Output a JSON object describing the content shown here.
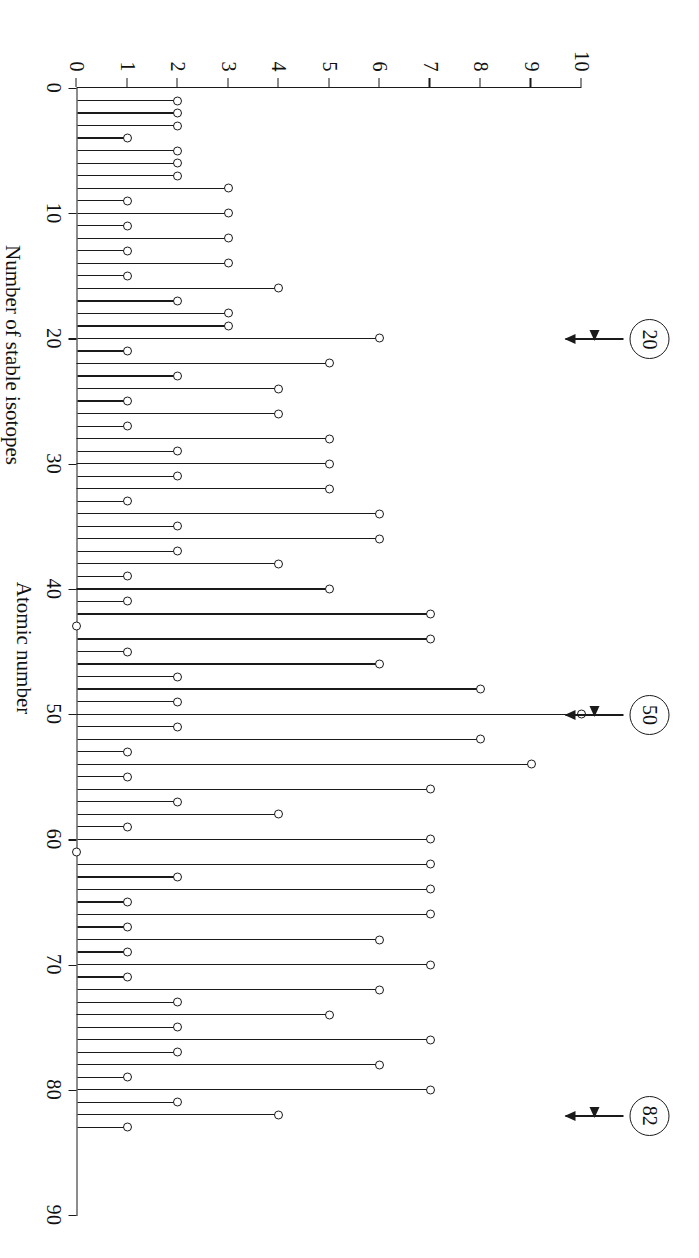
{
  "figure": {
    "kind": "stem-plot",
    "rotation_degrees": 90,
    "background_color": "#ffffff",
    "ink_color": "#1a1a1a"
  },
  "chart_data": {
    "type": "bar",
    "title": "",
    "xlabel": "Atomic number",
    "ylabel": "Number of stable isotopes",
    "xlim": [
      0,
      90
    ],
    "ylim": [
      0,
      10
    ],
    "xticks": [
      0,
      10,
      20,
      30,
      40,
      50,
      60,
      70,
      80,
      90
    ],
    "yticks": [
      0,
      1,
      2,
      3,
      4,
      5,
      6,
      7,
      8,
      9,
      10
    ],
    "grid": false,
    "legend": "none",
    "marker": "open-circle",
    "categories": [
      1,
      2,
      3,
      4,
      5,
      6,
      7,
      8,
      9,
      10,
      11,
      12,
      13,
      14,
      15,
      16,
      17,
      18,
      19,
      20,
      21,
      22,
      23,
      24,
      25,
      26,
      27,
      28,
      29,
      30,
      31,
      32,
      33,
      34,
      35,
      36,
      37,
      38,
      39,
      40,
      41,
      42,
      43,
      44,
      45,
      46,
      47,
      48,
      49,
      50,
      51,
      52,
      53,
      54,
      55,
      56,
      57,
      58,
      59,
      60,
      61,
      62,
      63,
      64,
      65,
      66,
      67,
      68,
      69,
      70,
      71,
      72,
      73,
      74,
      75,
      76,
      77,
      78,
      79,
      80,
      81,
      82,
      83
    ],
    "values": [
      2,
      2,
      2,
      1,
      2,
      2,
      2,
      3,
      1,
      3,
      1,
      3,
      1,
      3,
      1,
      4,
      2,
      3,
      3,
      6,
      1,
      5,
      2,
      4,
      1,
      4,
      1,
      5,
      2,
      5,
      2,
      5,
      1,
      6,
      2,
      6,
      2,
      4,
      1,
      5,
      1,
      7,
      0,
      7,
      1,
      6,
      2,
      8,
      2,
      10,
      2,
      8,
      1,
      9,
      1,
      7,
      2,
      4,
      1,
      7,
      0,
      7,
      2,
      7,
      1,
      7,
      1,
      6,
      1,
      7,
      1,
      6,
      2,
      5,
      2,
      7,
      2,
      6,
      1,
      7,
      2,
      4,
      1
    ],
    "annotations": [
      {
        "label": "20",
        "atomic_number": 20,
        "style": "circled-number-with-arrow"
      },
      {
        "label": "50",
        "atomic_number": 50,
        "style": "circled-number-with-arrow"
      },
      {
        "label": "82",
        "atomic_number": 82,
        "style": "circled-number-with-arrow"
      }
    ]
  },
  "axes": {
    "x": {
      "title": "Atomic number",
      "tick_labels": [
        "0",
        "10",
        "20",
        "30",
        "40",
        "50",
        "60",
        "70",
        "80",
        "90"
      ]
    },
    "y": {
      "title": "Number of stable isotopes",
      "tick_labels": [
        "0",
        "1",
        "2",
        "3",
        "4",
        "5",
        "6",
        "7",
        "8",
        "9",
        "10"
      ]
    }
  }
}
